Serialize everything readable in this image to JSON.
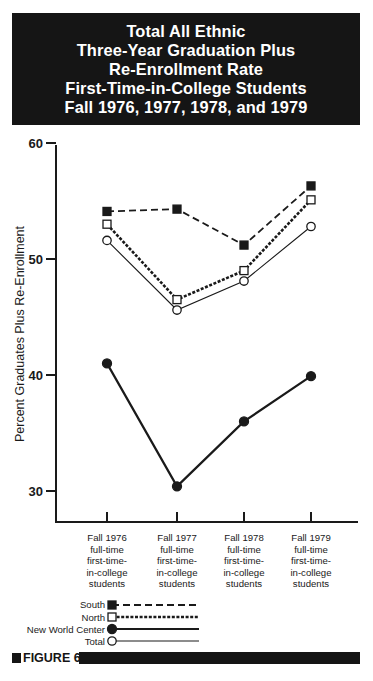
{
  "header": {
    "title_lines": [
      "Total All Ethnic",
      "Three-Year Graduation Plus",
      "Re-Enrollment Rate",
      "First-Time-in-College Students",
      "Fall 1976, 1977, 1978, and 1979"
    ]
  },
  "axis": {
    "ylabel": "Percent Graduates Plus Re-Enrollment",
    "yticks": [
      "60",
      "50",
      "40",
      "30"
    ],
    "categories": [
      [
        "Fall 1976",
        "full-time",
        "first-time-",
        "in-college",
        "students"
      ],
      [
        "Fall 1977",
        "full-time",
        "first-time-",
        "in-college",
        "students"
      ],
      [
        "Fall 1978",
        "full-time",
        "first-time-",
        "in-college",
        "students"
      ],
      [
        "Fall 1979",
        "full-time",
        "first-time-",
        "in-college",
        "students"
      ]
    ]
  },
  "legend": {
    "items": [
      "South",
      "North",
      "New World Center",
      "Total"
    ]
  },
  "footer": {
    "figure_label": "FIGURE 6"
  },
  "chart_data": {
    "type": "line",
    "title": "Total All Ethnic Three-Year Graduation Plus Re-Enrollment Rate First-Time-in-College Students Fall 1976, 1977, 1978, and 1979",
    "xlabel": "",
    "ylabel": "Percent Graduates Plus Re-Enrollment",
    "categories": [
      "Fall 1976 full-time first-time-in-college students",
      "Fall 1977 full-time first-time-in-college students",
      "Fall 1978 full-time first-time-in-college students",
      "Fall 1979 full-time first-time-in-college students"
    ],
    "ylim": [
      27.5,
      60
    ],
    "yticks": [
      30,
      40,
      50,
      60
    ],
    "grid": false,
    "legend_position": "bottom-left",
    "series": [
      {
        "name": "South",
        "marker": "filled-square",
        "line": "dashed-long",
        "values": [
          54.1,
          54.3,
          51.2,
          56.3
        ]
      },
      {
        "name": "North",
        "marker": "open-square",
        "line": "dashed-short-heavy",
        "values": [
          53.0,
          46.5,
          49.0,
          55.1
        ]
      },
      {
        "name": "New World Center",
        "marker": "filled-circle",
        "line": "solid-heavy",
        "values": [
          41.0,
          30.4,
          36.0,
          39.9
        ]
      },
      {
        "name": "Total",
        "marker": "open-circle",
        "line": "solid-thin",
        "values": [
          51.6,
          45.6,
          48.1,
          52.8
        ]
      }
    ]
  }
}
